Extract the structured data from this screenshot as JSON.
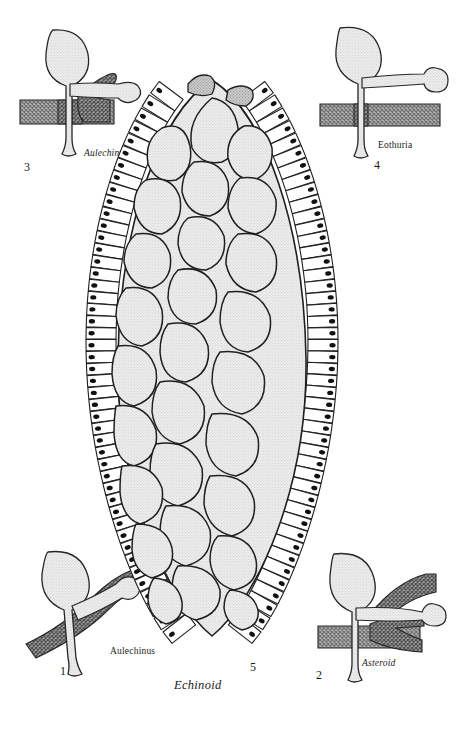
{
  "figure": {
    "title_species": "Aulechinus",
    "background_color": "#ffffff",
    "ink_color": "#1a1a1a",
    "plate_fill": "#e8e8e8",
    "dark_plate_fill": "#9a9a9a",
    "hatch_fill": "#8e8e8e"
  },
  "panels": [
    {
      "id": "central",
      "number": "1",
      "label": "Aulechinus",
      "label_style": "italic",
      "role": "whole-test-oral-view",
      "description": "Oral view of the test with irregular polygonal plates and marginal plate series bearing tubercles"
    },
    {
      "id": "asteroid",
      "number": "2",
      "label": "Asteroid",
      "label_style": "roman",
      "role": "podium-ambulacral-plate-relationship"
    },
    {
      "id": "aulechinus-detail",
      "number": "3",
      "label": "Aulechinus",
      "label_style": "italic",
      "role": "podium-ambulacral-plate-relationship"
    },
    {
      "id": "eothuria",
      "number": "4",
      "label": "Eothuria",
      "label_style": "italic",
      "role": "podium-ambulacral-plate-relationship"
    },
    {
      "id": "echinoid",
      "number": "5",
      "label": "Echinoid",
      "label_style": "roman",
      "role": "podium-ambulacral-plate-relationship"
    }
  ]
}
